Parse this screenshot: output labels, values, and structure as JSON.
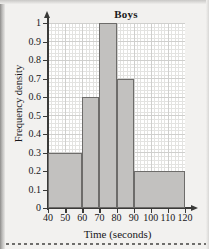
{
  "chart_data": {
    "type": "bar",
    "title": "Boys",
    "xlabel": "Time (seconds)",
    "ylabel": "Frequency density",
    "xlim": [
      40,
      120
    ],
    "ylim": [
      0,
      1
    ],
    "grid": true,
    "legend": null,
    "xticks": [
      "40",
      "50",
      "60",
      "70",
      "80",
      "90",
      "100",
      "110",
      "120"
    ],
    "xtick_values": [
      40,
      50,
      60,
      70,
      80,
      90,
      100,
      110,
      120
    ],
    "yticks": [
      "0",
      "0.1",
      "0.2",
      "0.3",
      "0.4",
      "0.5",
      "0.6",
      "0.7",
      "0.8",
      "0.9",
      "1"
    ],
    "ytick_values": [
      0,
      0.1,
      0.2,
      0.3,
      0.4,
      0.5,
      0.6,
      0.7,
      0.8,
      0.9,
      1
    ],
    "bars": [
      {
        "x0": 40,
        "x1": 60,
        "value": 0.3
      },
      {
        "x0": 60,
        "x1": 70,
        "value": 0.6
      },
      {
        "x0": 70,
        "x1": 80,
        "value": 1.0
      },
      {
        "x0": 80,
        "x1": 90,
        "value": 0.7
      },
      {
        "x0": 90,
        "x1": 120,
        "value": 0.2
      }
    ],
    "categories": [
      "40-60",
      "60-70",
      "70-80",
      "80-90",
      "90-120"
    ],
    "values": [
      0.3,
      0.6,
      1.0,
      0.7,
      0.2
    ],
    "colors": {
      "bar_fill": "#c2c1bf",
      "bar_edge": "#6d6c6a",
      "axis": "#3a3a38",
      "grid_major": "#cfcfcd",
      "grid_minor": "#e3e3e1",
      "plot_background": "#ffffff",
      "page_background": "#f2f1ef",
      "text": "#17171a"
    }
  }
}
